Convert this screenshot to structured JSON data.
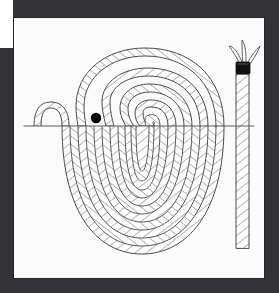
{
  "window": {
    "title": "",
    "frame_color": "#333335",
    "board_color": "#fbfbfb",
    "notch_color": "#ffffff"
  },
  "artwork": {
    "name": "coiled-rope-illustration",
    "description": "Line drawing of a three-strand rope coiled into a flat spiral, with the free end rising vertically at the right and finished with a black whipping band and three frayed strands fanning out.",
    "line_color": "#4a4a4a",
    "fill_color": "#ffffff",
    "accent_color": "#000000",
    "eye_dot": {
      "cx": 82,
      "cy": 100,
      "r": 5,
      "color": "#000000"
    },
    "whipping": {
      "x": 228,
      "y": 44,
      "w": 13,
      "h": 11,
      "color": "#111111"
    },
    "ground_line_y": 108,
    "coil_center": {
      "cx": 128,
      "cy": 112
    },
    "coil_rings": 11,
    "frayed_strands": 3
  },
  "canvas": {
    "width": 279,
    "height": 293,
    "board": {
      "left": 14,
      "top": 18,
      "width": 250,
      "height": 260
    }
  }
}
